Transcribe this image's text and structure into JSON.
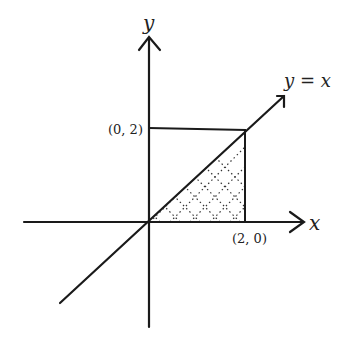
{
  "diagram": {
    "axes": {
      "x_label": "x",
      "y_label": "y"
    },
    "line": {
      "label": "y = x"
    },
    "points": [
      {
        "label": "(0, 2)"
      },
      {
        "label": "(2, 0)"
      }
    ],
    "region": {
      "description": "Triangle bounded by y = x, x-axis, and x = 2 (dotted hatching)"
    },
    "colors": {
      "ink": "#1a1a1a",
      "background": "#ffffff"
    }
  }
}
